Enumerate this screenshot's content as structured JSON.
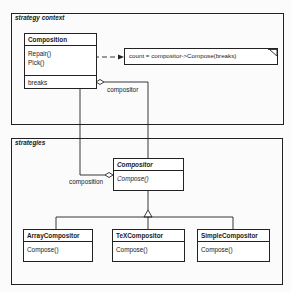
{
  "packages": {
    "context": {
      "label": "strategy context"
    },
    "strategies": {
      "label": "strategies"
    }
  },
  "classes": {
    "composition": {
      "name": "Composition",
      "methods": [
        "Repair()",
        "Pick()"
      ],
      "attributes": [
        "breaks"
      ]
    },
    "compositor": {
      "name": "Compositor",
      "abstract": true,
      "methods": [
        "Compose()"
      ]
    },
    "array_compositor": {
      "name": "ArrayCompositor",
      "methods": [
        "Compose()"
      ]
    },
    "tex_compositor": {
      "name": "TeXCompositor",
      "methods": [
        "Compose()"
      ]
    },
    "simple_compositor": {
      "name": "SimpleCompositor",
      "methods": [
        "Compose()"
      ]
    }
  },
  "note": {
    "text": "count = compositor->Compose(breaks)"
  },
  "associations": {
    "compositor_label": "compositor",
    "composition_label": "composition"
  }
}
